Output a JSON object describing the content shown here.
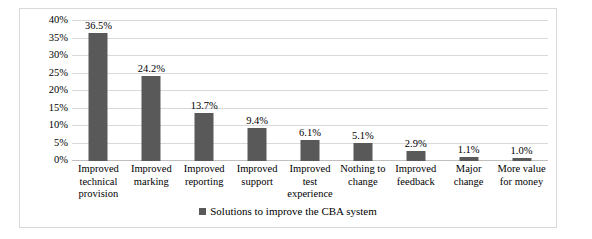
{
  "chart_data": {
    "type": "bar",
    "title": "",
    "xlabel": "",
    "ylabel": "",
    "ylim": [
      0,
      40
    ],
    "grid": true,
    "legend_position": "bottom",
    "legend": [
      "Solutions to improve the CBA system"
    ],
    "ytick_labels": [
      "40%",
      "35%",
      "30%",
      "25%",
      "20%",
      "15%",
      "10%",
      "5%",
      "0%"
    ],
    "ytick_values": [
      40,
      35,
      30,
      25,
      20,
      15,
      10,
      5,
      0
    ],
    "categories": [
      "Improved technical provision",
      "Improved marking",
      "Improved reporting",
      "Improved support",
      "Improved test experience",
      "Nothing to change",
      "Improved feedback",
      "Major change",
      "More value for money"
    ],
    "category_lines": [
      [
        "Improved",
        "technical",
        "provision"
      ],
      [
        "Improved",
        "marking"
      ],
      [
        "Improved",
        "reporting"
      ],
      [
        "Improved",
        "support"
      ],
      [
        "Improved test",
        "experience"
      ],
      [
        "Nothing to",
        "change"
      ],
      [
        "Improved",
        "feedback"
      ],
      [
        "Major change"
      ],
      [
        "More value",
        "for money"
      ]
    ],
    "values": [
      36.5,
      24.2,
      13.7,
      9.4,
      6.1,
      5.1,
      2.9,
      1.1,
      1.0
    ],
    "data_labels": [
      "36.5%",
      "24.2%",
      "13.7%",
      "9.4%",
      "6.1%",
      "5.1%",
      "2.9%",
      "1.1%",
      "1.0%"
    ],
    "series": [
      {
        "name": "Solutions to improve the CBA system",
        "color": "#595959",
        "values": [
          36.5,
          24.2,
          13.7,
          9.4,
          6.1,
          5.1,
          2.9,
          1.1,
          1.0
        ]
      }
    ],
    "colors": {
      "bar": "#595959",
      "gridline": "#d9d9d9",
      "axis": "#bfbfbf",
      "frame": "#d9d9d9",
      "background": "#ffffff",
      "text": "#000000"
    }
  }
}
